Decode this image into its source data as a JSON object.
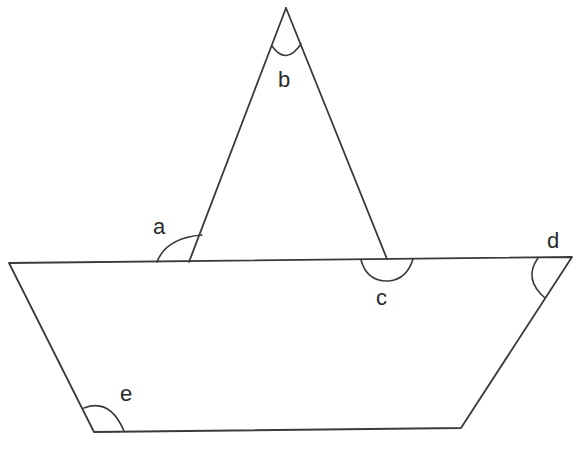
{
  "diagram": {
    "type": "geometry",
    "colors": {
      "background": "#ffffff",
      "stroke": "#3a3a3a",
      "text": "#2a2a2a"
    },
    "angles": [
      {
        "id": "a",
        "label": "a",
        "location": "exterior angle at left base of triangle"
      },
      {
        "id": "b",
        "label": "b",
        "location": "apex of triangle"
      },
      {
        "id": "c",
        "label": "c",
        "location": "below right base of triangle on trapezoid top line"
      },
      {
        "id": "d",
        "label": "d",
        "location": "top-right interior angle of trapezoid"
      },
      {
        "id": "e",
        "label": "e",
        "location": "bottom-left interior angle of trapezoid"
      }
    ]
  }
}
